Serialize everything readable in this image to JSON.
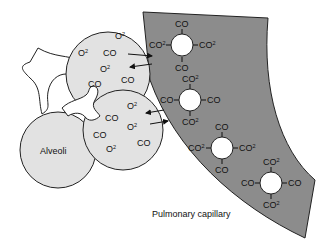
{
  "diagram": {
    "labels": {
      "alveoli": "Alveoli",
      "capillary": "Pulmonary capillary"
    },
    "colors": {
      "capillary_fill": "#8c8c8c",
      "alveolus_fill": "#e2e2e2",
      "cell_fill": "#ffffff",
      "stroke": "#222222"
    },
    "upper_alveolus_molecules": [
      "O",
      "O",
      "CO",
      "O",
      "CO",
      "CO",
      "O"
    ],
    "lower_alveolus_molecules": [
      "O",
      "CO",
      "O",
      "CO",
      "O",
      "CO",
      "O"
    ],
    "red_blood_cells": [
      {
        "top": "CO",
        "left": "CO",
        "right": "CO",
        "bottom": "CO",
        "left_sup": "2",
        "right_sup": "2"
      },
      {
        "top": "CO",
        "left": "CO",
        "right": "CO",
        "bottom": "CO",
        "top_sup": "2",
        "bottom_sup": "2"
      },
      {
        "top": "CO",
        "left": "CO",
        "right": "CO",
        "bottom": "CO",
        "left_sup": "2",
        "right_sup": "2"
      },
      {
        "top": "CO",
        "left": "CO",
        "right": "CO",
        "bottom": "CO",
        "top_sup": "2",
        "bottom_sup": "2"
      }
    ],
    "sup": "2",
    "arrows": [
      "O2 into capillary",
      "CO out of capillary",
      "CO out of capillary",
      "O2 into capillary"
    ]
  }
}
